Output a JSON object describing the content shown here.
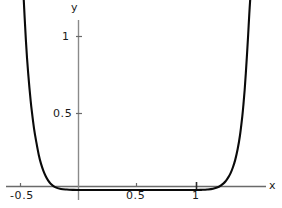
{
  "figure": {
    "background_color": "#ffffff",
    "axis_color": "#555555",
    "curve_color": "#0a0a0a",
    "text_color": "#1a1a1a"
  },
  "chart_data": {
    "type": "line",
    "title": "",
    "subtitle": "",
    "xlabel": "x",
    "ylabel": "y",
    "legend": [],
    "legend_position": "none",
    "grid": false,
    "frame": false,
    "axes_style": "crossed-axes-at-origin",
    "xlim": [
      -0.62,
      1.6
    ],
    "ylim": [
      -0.03,
      1.28
    ],
    "xticks": [
      -0.5,
      0.5,
      1
    ],
    "xtick_labels": [
      "-0.5",
      "0.5",
      "1"
    ],
    "yticks": [
      0.5,
      1
    ],
    "ytick_labels": [
      "0.5",
      "1"
    ],
    "x": [
      -0.47,
      -0.46,
      -0.45,
      -0.44,
      -0.43,
      -0.42,
      -0.41,
      -0.4,
      -0.38,
      -0.36,
      -0.34,
      -0.32,
      -0.3,
      -0.28,
      -0.26,
      -0.24,
      -0.2,
      -0.15,
      -0.1,
      -0.05,
      0.0,
      0.1,
      0.2,
      0.3,
      0.4,
      0.5,
      0.6,
      0.7,
      0.8,
      0.9,
      1.0,
      1.05,
      1.1,
      1.15,
      1.2,
      1.24,
      1.26,
      1.28,
      1.3,
      1.32,
      1.34,
      1.36,
      1.38,
      1.4,
      1.41,
      1.42,
      1.43,
      1.44,
      1.45,
      1.46,
      1.47
    ],
    "y": [
      1.27,
      1.12,
      0.98,
      0.86,
      0.76,
      0.67,
      0.59,
      0.52,
      0.4,
      0.31,
      0.23,
      0.17,
      0.125,
      0.09,
      0.063,
      0.043,
      0.019,
      0.007,
      0.003,
      0.001,
      0.0,
      0.0,
      0.0,
      0.0,
      0.0,
      0.0,
      0.0,
      0.0,
      0.0,
      0.0,
      0.0,
      0.001,
      0.003,
      0.008,
      0.021,
      0.043,
      0.06,
      0.082,
      0.11,
      0.148,
      0.198,
      0.265,
      0.355,
      0.48,
      0.56,
      0.65,
      0.76,
      0.88,
      1.01,
      1.15,
      1.27
    ]
  }
}
